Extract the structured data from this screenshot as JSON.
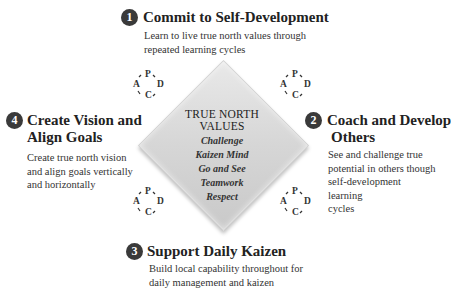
{
  "diagram": {
    "center": {
      "title_line1": "TRUE NORTH",
      "title_line2": "VALUES",
      "values": [
        "Challenge",
        "Kaizen Mind",
        "Go and See",
        "Teamwork",
        "Respect"
      ]
    },
    "steps": [
      {
        "number": "1",
        "title": "Commit to Self-Development",
        "desc_line1": "Learn to live true north values through",
        "desc_line2": "repeated learning cycles"
      },
      {
        "number": "2",
        "title_line1": "Coach and Develop",
        "title_line2": "Others",
        "desc_line1": "See and challenge true",
        "desc_line2": "potential in others though",
        "desc_line3": "self-development learning",
        "desc_line4": "cycles"
      },
      {
        "number": "3",
        "title": "Support Daily Kaizen",
        "desc_line1": "Build local capability throughout for",
        "desc_line2": "daily management and kaizen"
      },
      {
        "number": "4",
        "title_line1": "Create Vision and",
        "title_line2": "Align Goals",
        "desc_line1": "Create true north vision",
        "desc_line2": "and align goals vertically",
        "desc_line3": "and horizontally"
      }
    ],
    "pdca": {
      "p": "P",
      "d": "D",
      "c": "C",
      "a": "A"
    }
  }
}
